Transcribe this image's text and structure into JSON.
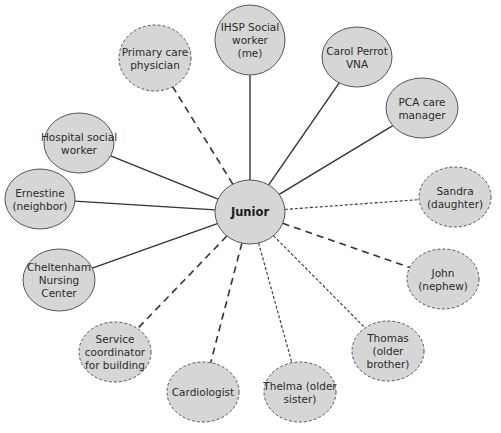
{
  "diagram": {
    "type": "ecomap",
    "colors": {
      "node_fill": "#d6d6d6",
      "node_stroke": "#555555",
      "line": "#333333",
      "background": "#ffffff"
    },
    "center": {
      "label": "Junior",
      "cx": 250,
      "cy": 212,
      "rx": 35,
      "ry": 32
    },
    "nodes": [
      {
        "id": "ihsp",
        "lines": [
          "IHSP Social",
          "worker",
          "(me)"
        ],
        "cx": 250,
        "cy": 40,
        "rx": 35,
        "ry": 35,
        "border": "solid",
        "link": "solid"
      },
      {
        "id": "primary-care",
        "lines": [
          "Primary care",
          "physician"
        ],
        "cx": 155,
        "cy": 58,
        "rx": 36,
        "ry": 33,
        "border": "dashed",
        "link": "long-dash"
      },
      {
        "id": "carol",
        "lines": [
          "Carol Perrot",
          "VNA"
        ],
        "cx": 357,
        "cy": 57,
        "rx": 35,
        "ry": 30,
        "border": "solid",
        "link": "solid"
      },
      {
        "id": "pca",
        "lines": [
          "PCA care",
          "manager"
        ],
        "cx": 422,
        "cy": 108,
        "rx": 36,
        "ry": 30,
        "border": "solid",
        "link": "solid"
      },
      {
        "id": "hospital",
        "lines": [
          "Hospital social",
          "worker"
        ],
        "cx": 79,
        "cy": 143,
        "rx": 35,
        "ry": 30,
        "border": "solid",
        "link": "solid"
      },
      {
        "id": "ernestine",
        "lines": [
          "Ernestine",
          "(neighbor)"
        ],
        "cx": 40,
        "cy": 199,
        "rx": 35,
        "ry": 30,
        "border": "solid",
        "link": "solid"
      },
      {
        "id": "sandra",
        "lines": [
          "Sandra",
          "(daughter)"
        ],
        "cx": 455,
        "cy": 197,
        "rx": 36,
        "ry": 30,
        "border": "dashed",
        "link": "short-dash"
      },
      {
        "id": "cheltenham",
        "lines": [
          "Cheltenham",
          "Nursing",
          "Center"
        ],
        "cx": 59,
        "cy": 280,
        "rx": 36,
        "ry": 31,
        "border": "solid",
        "link": "solid"
      },
      {
        "id": "john",
        "lines": [
          "John",
          "(nephew)"
        ],
        "cx": 443,
        "cy": 279,
        "rx": 36,
        "ry": 30,
        "border": "dashed",
        "link": "long-dash"
      },
      {
        "id": "service-coordinator",
        "lines": [
          "Service",
          "coordinator",
          "for building"
        ],
        "cx": 115,
        "cy": 352,
        "rx": 36,
        "ry": 30,
        "border": "dashed",
        "link": "long-dash"
      },
      {
        "id": "thomas",
        "lines": [
          "Thomas",
          "(older",
          "brother)"
        ],
        "cx": 388,
        "cy": 351,
        "rx": 36,
        "ry": 30,
        "border": "dashed",
        "link": "short-dash"
      },
      {
        "id": "cardiologist",
        "lines": [
          "Cardiologist"
        ],
        "cx": 203,
        "cy": 392,
        "rx": 36,
        "ry": 30,
        "border": "dashed",
        "link": "long-dash"
      },
      {
        "id": "thelma",
        "lines": [
          "Thelma (older",
          "sister)"
        ],
        "cx": 300,
        "cy": 392,
        "rx": 36,
        "ry": 30,
        "border": "dashed",
        "link": "short-dash"
      }
    ]
  }
}
